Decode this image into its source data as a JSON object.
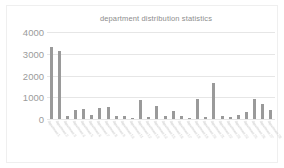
{
  "chart_data": {
    "type": "bar",
    "title": "department distribution statistics",
    "xlabel": "",
    "ylabel": "",
    "ylim": [
      0,
      4000
    ],
    "ytick_labels": [
      "4000",
      "3000",
      "2000",
      "1000",
      "0"
    ],
    "yticks": [
      4000,
      3000,
      2000,
      1000,
      0
    ],
    "grid": true,
    "legend": "none",
    "bar_color": "#9a9a9a",
    "categories": [
      "department 1",
      "department 2",
      "department 3",
      "department 4",
      "department 5",
      "department 6",
      "department 7",
      "department 8",
      "department 9",
      "department 10",
      "department 11",
      "department 12",
      "department 13",
      "department 14",
      "department 15",
      "department 16",
      "department 17",
      "department 18",
      "department 19",
      "department 20",
      "department 21",
      "department 22",
      "department 23",
      "department 24",
      "department 25",
      "department 26",
      "department 27",
      "department 28"
    ],
    "values": [
      3330,
      3120,
      150,
      400,
      480,
      170,
      520,
      560,
      130,
      120,
      60,
      860,
      100,
      620,
      120,
      380,
      130,
      60,
      900,
      110,
      1650,
      130,
      110,
      170,
      330,
      900,
      690,
      400
    ]
  },
  "chart": {
    "title": "department distribution statistics"
  },
  "xtail": {
    "values": [
      210,
      300,
      310
    ]
  }
}
